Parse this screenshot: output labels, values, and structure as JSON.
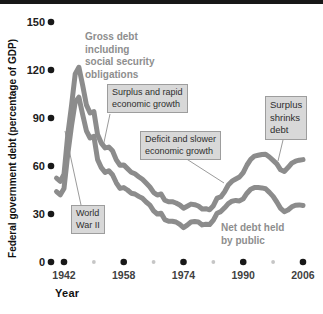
{
  "figure": {
    "background": "#ffffff",
    "top_bar_color": "#181818"
  },
  "chart_data": {
    "type": "line",
    "title": "",
    "xlabel": "Year",
    "ylabel": "Federal government debt (percentage of GDP)",
    "x_ticks_major": [
      1942,
      1958,
      1974,
      1990,
      2006
    ],
    "x_ticks_minor": [
      1950,
      1966,
      1982,
      1998
    ],
    "y_ticks": [
      0,
      30,
      60,
      90,
      120,
      150
    ],
    "xlim": [
      1940,
      2006
    ],
    "ylim": [
      0,
      150
    ],
    "grid": false,
    "legend": "none (lines labeled directly on chart)",
    "line_color": "#8c8c8c",
    "tick_dot_color": "#181818",
    "minor_tick_dot_color": "#c6c6c6",
    "years": [
      1940,
      1941,
      1942,
      1943,
      1944,
      1945,
      1946,
      1947,
      1948,
      1949,
      1950,
      1951,
      1952,
      1953,
      1954,
      1955,
      1956,
      1957,
      1958,
      1959,
      1960,
      1961,
      1962,
      1963,
      1964,
      1965,
      1966,
      1967,
      1968,
      1969,
      1970,
      1971,
      1972,
      1973,
      1974,
      1975,
      1976,
      1977,
      1978,
      1979,
      1980,
      1981,
      1982,
      1983,
      1984,
      1985,
      1986,
      1987,
      1988,
      1989,
      1990,
      1991,
      1992,
      1993,
      1994,
      1995,
      1996,
      1997,
      1998,
      1999,
      2000,
      2001,
      2002,
      2003,
      2004,
      2005,
      2006
    ],
    "series": [
      {
        "name": "Gross debt including social security obligations",
        "values": [
          52.4,
          50.4,
          54.9,
          79.1,
          97.6,
          117.5,
          121.7,
          110.3,
          98.2,
          93.1,
          94.0,
          79.6,
          74.3,
          71.3,
          71.8,
          69.5,
          63.8,
          60.5,
          60.7,
          58.4,
          56.1,
          55.1,
          53.3,
          51.7,
          49.3,
          46.9,
          43.5,
          41.8,
          42.5,
          38.6,
          37.6,
          37.7,
          36.9,
          35.6,
          33.6,
          34.9,
          36.2,
          35.8,
          35.0,
          33.2,
          33.3,
          32.6,
          35.2,
          39.9,
          40.7,
          43.9,
          48.1,
          50.5,
          51.9,
          53.1,
          55.9,
          60.6,
          64.1,
          66.2,
          66.7,
          67.2,
          67.3,
          65.6,
          63.5,
          61.4,
          57.6,
          56.6,
          59.0,
          61.8,
          63.0,
          63.6,
          64.0
        ]
      },
      {
        "name": "Net debt held by public",
        "values": [
          44,
          42,
          46,
          67,
          85,
          100,
          103,
          92,
          82,
          77.5,
          78.5,
          64,
          59,
          56,
          57,
          54.5,
          49.5,
          46,
          46.5,
          45,
          43,
          42.5,
          41,
          39.8,
          37.5,
          35.5,
          32,
          30,
          30.5,
          26.5,
          25.5,
          25.5,
          25,
          23.5,
          21.5,
          23,
          25,
          25.3,
          25,
          23.2,
          23.6,
          23.4,
          26.2,
          30.5,
          31.5,
          33.9,
          36.5,
          38,
          38.5,
          38.2,
          39.5,
          43,
          45.5,
          46.5,
          46.5,
          46.3,
          45.8,
          43.5,
          41,
          37.5,
          33.5,
          31.5,
          32.5,
          34.5,
          35.5,
          35.7,
          35.3
        ]
      }
    ],
    "annotations": {
      "gross_label_lines": [
        "Gross debt",
        "including",
        "social security",
        "obligations"
      ],
      "net_label_lines": [
        "Net debt held",
        "by public"
      ],
      "world_war_2_lines": [
        "World",
        "War II"
      ],
      "surplus_rapid_lines": [
        "Surplus and rapid",
        "economic growth"
      ],
      "deficit_slower_lines": [
        "Deficit and slower",
        "economic growth"
      ],
      "surplus_shrinks_lines": [
        "Surplus",
        "shrinks",
        "debt"
      ]
    }
  }
}
